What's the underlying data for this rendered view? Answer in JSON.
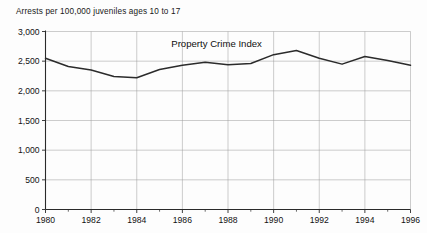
{
  "figure": {
    "axis_caption": "Arrests per 100,000 juveniles ages 10 to 17",
    "title": "Property Crime Index"
  },
  "chart_data": {
    "type": "line",
    "title": "Property Crime Index",
    "subtitle": "",
    "xlabel": "",
    "ylabel": "Arrests per 100,000 juveniles ages 10 to 17",
    "x": [
      1980,
      1981,
      1982,
      1983,
      1984,
      1985,
      1986,
      1987,
      1988,
      1989,
      1990,
      1991,
      1992,
      1993,
      1994,
      1995,
      1996
    ],
    "values": [
      2550,
      2410,
      2350,
      2240,
      2220,
      2360,
      2430,
      2480,
      2440,
      2460,
      2610,
      2680,
      2550,
      2450,
      2580,
      2510,
      2430
    ],
    "series": [
      {
        "name": "Property Crime Index",
        "values": [
          2550,
          2410,
          2350,
          2240,
          2220,
          2360,
          2430,
          2480,
          2440,
          2460,
          2610,
          2680,
          2550,
          2450,
          2580,
          2510,
          2430
        ]
      }
    ],
    "xlim": [
      1980,
      1996
    ],
    "ylim": [
      0,
      3000
    ],
    "ytick_labels": [
      "0",
      "500",
      "1,000",
      "1,500",
      "2,000",
      "2,500",
      "3,000"
    ],
    "ytick_values": [
      0,
      500,
      1000,
      1500,
      2000,
      2500,
      3000
    ],
    "xtick_labels": [
      "1980",
      "1982",
      "1984",
      "1986",
      "1988",
      "1990",
      "1992",
      "1994",
      "1996"
    ],
    "xtick_values": [
      1980,
      1982,
      1984,
      1986,
      1988,
      1990,
      1992,
      1994,
      1996
    ],
    "xtick_minor_values": [
      1981,
      1983,
      1985,
      1987,
      1989,
      1991,
      1993,
      1995
    ],
    "grid": true,
    "legend": false,
    "legend_position": "none",
    "line_color": "#2b2b2b",
    "grid_color": "#9a9a9a",
    "axis_color": "#2a2a2a"
  }
}
